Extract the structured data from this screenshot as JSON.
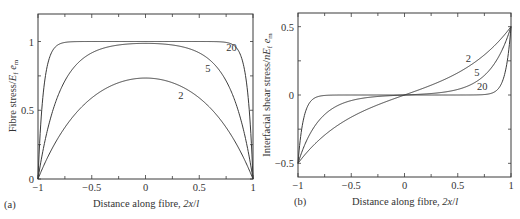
{
  "chart_data": [
    {
      "type": "line",
      "panel": "(a)",
      "xlabel": "Distance along fibre, 2x/l",
      "ylabel": "Fibre stress/E_f e_m",
      "xlim": [
        -1,
        1
      ],
      "ylim": [
        0,
        1.2
      ],
      "xticks": [
        -1,
        -0.5,
        0,
        0.5,
        1
      ],
      "xtick_labels": [
        "−1",
        "−0.5",
        "0",
        "0.5",
        "1"
      ],
      "yticks": [
        0,
        0.5,
        1
      ],
      "ytick_labels": [
        "0",
        "0.5",
        "1"
      ],
      "grid": false,
      "legend": "inline curve labels",
      "x": [
        -1,
        -0.9,
        -0.75,
        -0.5,
        -0.25,
        0,
        0.25,
        0.5,
        0.75,
        0.9,
        1
      ],
      "series": [
        {
          "name": "2",
          "param_ns": 2,
          "values": [
            0,
            0.2,
            0.4,
            0.58,
            0.69,
            0.73,
            0.69,
            0.58,
            0.4,
            0.2,
            0
          ]
        },
        {
          "name": "5",
          "param_ns": 5,
          "values": [
            0,
            0.39,
            0.71,
            0.92,
            0.98,
            0.99,
            0.98,
            0.92,
            0.71,
            0.39,
            0
          ]
        },
        {
          "name": "20",
          "param_ns": 20,
          "values": [
            0,
            0.86,
            0.99,
            1.0,
            1.0,
            1.0,
            1.0,
            1.0,
            0.99,
            0.86,
            0
          ]
        }
      ],
      "curve_labels": [
        {
          "text": "20",
          "x": 0.8,
          "y": 0.93
        },
        {
          "text": "5",
          "x": 0.58,
          "y": 0.78
        },
        {
          "text": "2",
          "x": 0.33,
          "y": 0.58
        }
      ]
    },
    {
      "type": "line",
      "panel": "(b)",
      "xlabel": "Distance along fibre, 2x/l",
      "ylabel": "Interfacial shear stress/nE_f e_m",
      "xlim": [
        -1,
        1
      ],
      "ylim": [
        -0.6,
        0.6
      ],
      "xticks": [
        -1,
        -0.5,
        0,
        0.5,
        1
      ],
      "xtick_labels": [
        "−1",
        "−0.5",
        "0",
        "0.5",
        "1"
      ],
      "yticks": [
        -0.5,
        0,
        0.5
      ],
      "ytick_labels": [
        "−0.5",
        "0",
        "0.5"
      ],
      "grid": false,
      "legend": "inline curve labels",
      "x": [
        -1,
        -0.9,
        -0.75,
        -0.5,
        -0.25,
        0,
        0.25,
        0.5,
        0.75,
        0.9,
        1
      ],
      "series": [
        {
          "name": "2",
          "param_ns": 2,
          "values": [
            -0.5,
            -0.41,
            -0.3,
            -0.16,
            -0.07,
            0,
            0.07,
            0.16,
            0.3,
            0.41,
            0.5
          ]
        },
        {
          "name": "5",
          "param_ns": 5,
          "values": [
            -0.5,
            -0.3,
            -0.14,
            -0.04,
            -0.01,
            0,
            0.01,
            0.04,
            0.14,
            0.3,
            0.5
          ]
        },
        {
          "name": "20",
          "param_ns": 20,
          "values": [
            -0.5,
            -0.07,
            0.0,
            0.0,
            0.0,
            0,
            0.0,
            0.0,
            0.0,
            0.07,
            0.5
          ]
        }
      ],
      "curve_labels": [
        {
          "text": "2",
          "x": 0.6,
          "y": 0.24
        },
        {
          "text": "5",
          "x": 0.68,
          "y": 0.14
        },
        {
          "text": "20",
          "x": 0.73,
          "y": 0.04
        }
      ]
    }
  ],
  "panels": {
    "a": {
      "label": "(a)",
      "xlabel": "Distance along fibre, 2x/l",
      "ylabel": "Fibre stress/E_f e_m"
    },
    "b": {
      "label": "(b)",
      "xlabel": "Distance along fibre, 2x/l",
      "ylabel": "Interfacial shear stress/nE_f e_m"
    }
  },
  "style": {
    "line_color": "#3a3a3a",
    "frame_color": "#3a3a3a",
    "background": "#ffffff"
  }
}
